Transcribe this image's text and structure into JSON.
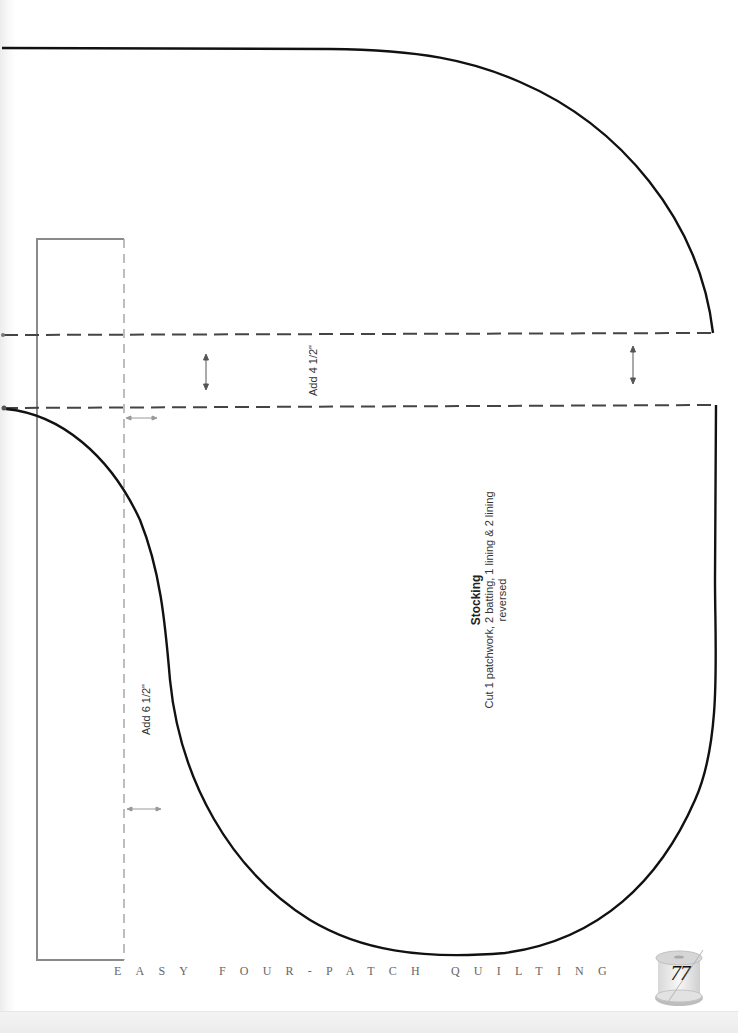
{
  "pattern": {
    "piece_name": "Stocking",
    "cut_instructions": "Cut 1 patchwork, 2 batting, 1 lining & 2 lining reversed",
    "band_extension_label": "Add 4 1/2\"",
    "toe_extension_label": "Add 6 1/2\"",
    "line_colors": {
      "cutting_line": "#111111",
      "fold_dashes": "#444444",
      "guide_box": "#8a8a8a",
      "arrows": "#888888"
    }
  },
  "footer": {
    "book_title": "EASY FOUR-PATCH QUILTING",
    "page_number": "77",
    "badge_icon": "thread-spool-icon"
  }
}
